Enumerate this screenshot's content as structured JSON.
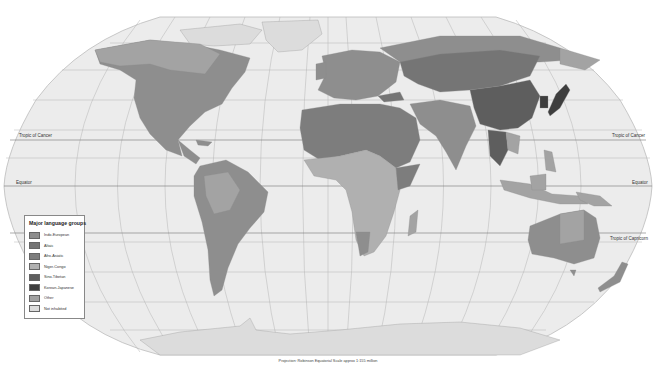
{
  "map": {
    "projection_note": "Projection: Robinson    Equatorial Scale approx 1:155 million",
    "reference_lines": {
      "tropic_of_cancer": "Tropic of Cancer",
      "equator": "Equator",
      "tropic_of_capricorn": "Tropic of Capricorn"
    },
    "legend": {
      "title": "Major language groups",
      "items": [
        {
          "label": "Indo-European",
          "color": "#8e8e8e"
        },
        {
          "label": "Altaic",
          "color": "#757575"
        },
        {
          "label": "Afro-Asiatic",
          "color": "#7d7d7d"
        },
        {
          "label": "Niger-Congo",
          "color": "#b0b0b0"
        },
        {
          "label": "Sino-Tibetan",
          "color": "#5e5e5e"
        },
        {
          "label": "Korean-Japanese",
          "color": "#3e3e3e"
        },
        {
          "label": "Other",
          "color": "#a3a3a3"
        },
        {
          "label": "Not inhabited",
          "color": "#dcdcdc"
        }
      ]
    },
    "colors": {
      "ocean": "#ececec",
      "graticule": "#a8a8a8",
      "border": "#999999"
    }
  }
}
